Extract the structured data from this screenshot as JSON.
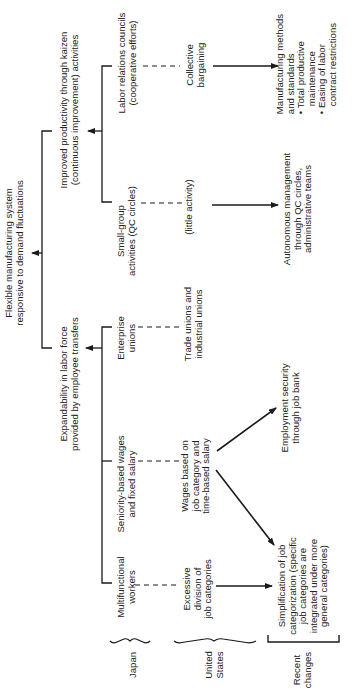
{
  "diagram": {
    "title": "Flexible manufacturing system\nresponsive to demand fluctuations",
    "branches": {
      "productivity": "Improved productivity through kaizen\n(continuous improvement) activities",
      "expandability": "Expandability in labor force\nprovided by employee transfers"
    },
    "japan_items": {
      "labor_councils": "Labor relations councils\n(cooperative efforts)",
      "small_group": "Small-group\nactivities (QC circles)",
      "enterprise_unions": "Enterprise\nunions",
      "seniority_wages": "Seniority-based wages\nand fixed salary",
      "multifunctional": "Multifunctional\nworkers"
    },
    "us_items": {
      "collective_bargaining": "Collective\nbargaining",
      "little_activity": "(little activity)",
      "trade_unions": "Trade unions and\nindustrial unions",
      "wages_job_category": "Wages based on\njob category and\ntime-based salary",
      "excessive_division": "Excessive\ndivision of\njob categories"
    },
    "recent_changes": {
      "manufacturing_methods": "Manufacturing methods\nand standards\n• Total productive\n   maintenance\n• Easing of labor\n   contract restrictions",
      "autonomous_management": "Autonomous management\nthrough QC circles,\nadministrative teams",
      "employment_security": "Employment security\nthrough job bank",
      "simplification": "Simplification of job\ncategorization (specific\njob categories are\nintegrated under more\ngeneral categories)"
    },
    "row_labels": {
      "japan": "Japan",
      "united_states": "United\nStates",
      "recent_changes": "Recent\nchanges"
    },
    "colors": {
      "line": "#1a1a1a",
      "text": "#222222",
      "background": "#ffffff"
    }
  }
}
